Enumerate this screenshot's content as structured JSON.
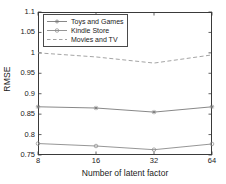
{
  "chart_data": {
    "type": "line",
    "title": "",
    "xlabel": "Number of latent factor",
    "ylabel": "RMSE",
    "categories": [
      "8",
      "16",
      "32",
      "64"
    ],
    "x_tick_labels": [
      "8",
      "16",
      "32",
      "64"
    ],
    "y_tick_labels": [
      "0.75",
      "0.8",
      "0.85",
      "0.9",
      "0.95",
      "1",
      "1.05",
      "1.1"
    ],
    "y_tick_values": [
      0.75,
      0.8,
      0.85,
      0.9,
      0.95,
      1.0,
      1.05,
      1.1
    ],
    "ylim": [
      0.75,
      1.1
    ],
    "grid": false,
    "legend_position": "upper-left-inside",
    "series": [
      {
        "name": "Toys and Games",
        "values": [
          0.868,
          0.865,
          0.855,
          0.868
        ],
        "marker": "star",
        "linestyle": "solid",
        "color": "#7a7a7a"
      },
      {
        "name": "Kindle Store",
        "values": [
          0.778,
          0.772,
          0.763,
          0.777
        ],
        "marker": "circle",
        "linestyle": "solid",
        "color": "#8a8a8a"
      },
      {
        "name": "Movies and TV",
        "values": [
          1.0,
          0.99,
          0.975,
          0.995
        ],
        "marker": "none",
        "linestyle": "dashed",
        "color": "#9a9a9a"
      }
    ]
  },
  "legend": {
    "entries": [
      {
        "label": "Toys and Games"
      },
      {
        "label": "Kindle Store"
      },
      {
        "label": "Movies and TV"
      }
    ]
  },
  "axes": {
    "x_title": "Number of latent factor",
    "y_title": "RMSE"
  }
}
